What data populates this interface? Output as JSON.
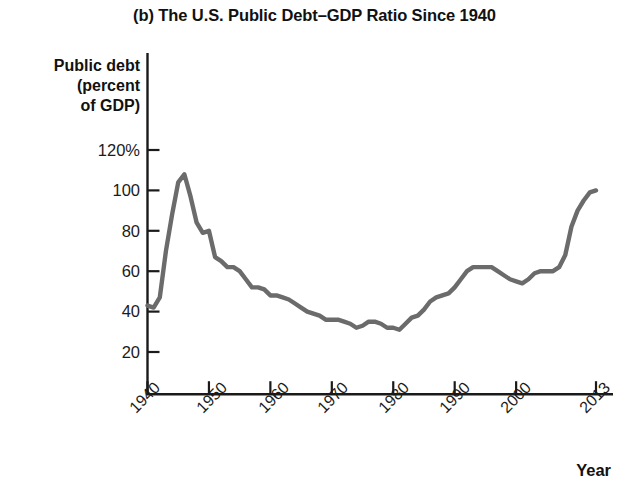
{
  "chart_data": {
    "type": "line",
    "title": "(b) The U.S. Public Debt–GDP Ratio Since 1940",
    "xlabel": "Year",
    "ylabel": "Public debt (percent of GDP)",
    "ylabel_lines": [
      "Public debt",
      "(percent",
      "of GDP)"
    ],
    "xlim": [
      1940,
      2013
    ],
    "ylim": [
      0,
      126
    ],
    "grid": false,
    "legend": "none",
    "line_color": "#6b6b6b",
    "axis_color": "#1a1a1a",
    "y_ticks": [
      {
        "value": 120,
        "label": "120%"
      },
      {
        "value": 100,
        "label": "100"
      },
      {
        "value": 80,
        "label": "80"
      },
      {
        "value": 60,
        "label": "60"
      },
      {
        "value": 40,
        "label": "40"
      },
      {
        "value": 20,
        "label": "20"
      }
    ],
    "x_ticks": [
      {
        "value": 1940,
        "label": "1940"
      },
      {
        "value": 1950,
        "label": "1950"
      },
      {
        "value": 1960,
        "label": "1960"
      },
      {
        "value": 1970,
        "label": "1970"
      },
      {
        "value": 1980,
        "label": "1980"
      },
      {
        "value": 1990,
        "label": "1990"
      },
      {
        "value": 2000,
        "label": "2000"
      },
      {
        "value": 2013,
        "label": "2013"
      }
    ],
    "series": [
      {
        "name": "U.S. public debt as percent of GDP",
        "x": [
          1940,
          1941,
          1942,
          1943,
          1944,
          1945,
          1946,
          1947,
          1948,
          1949,
          1950,
          1951,
          1952,
          1953,
          1954,
          1955,
          1956,
          1957,
          1958,
          1959,
          1960,
          1961,
          1962,
          1963,
          1964,
          1965,
          1966,
          1967,
          1968,
          1969,
          1970,
          1971,
          1972,
          1973,
          1974,
          1975,
          1976,
          1977,
          1978,
          1979,
          1980,
          1981,
          1982,
          1983,
          1984,
          1985,
          1986,
          1987,
          1988,
          1989,
          1990,
          1991,
          1992,
          1993,
          1994,
          1995,
          1996,
          1997,
          1998,
          1999,
          2000,
          2001,
          2002,
          2003,
          2004,
          2005,
          2006,
          2007,
          2008,
          2009,
          2010,
          2011,
          2012,
          2013
        ],
        "values": [
          43,
          42,
          47,
          70,
          88,
          104,
          108,
          97,
          84,
          79,
          80,
          67,
          65,
          62,
          62,
          60,
          56,
          52,
          52,
          51,
          48,
          48,
          47,
          46,
          44,
          42,
          40,
          39,
          38,
          36,
          36,
          36,
          35,
          34,
          32,
          33,
          35,
          35,
          34,
          32,
          32,
          31,
          34,
          37,
          38,
          41,
          45,
          47,
          48,
          49,
          52,
          56,
          60,
          62,
          62,
          62,
          62,
          60,
          58,
          56,
          55,
          54,
          56,
          59,
          60,
          60,
          60,
          62,
          68,
          82,
          90,
          95,
          99,
          100
        ]
      }
    ],
    "annotations": {
      "peak": {
        "year": 1946,
        "value": 108
      },
      "trough": {
        "year": 1974,
        "value": 23
      },
      "end": {
        "year": 2013,
        "value": 71
      }
    }
  }
}
